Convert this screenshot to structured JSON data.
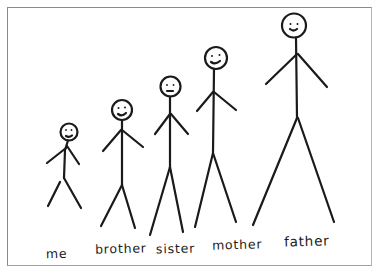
{
  "drawing": {
    "description": "Hand-drawn family of stick figures arranged by height",
    "figures": [
      {
        "id": "me",
        "label": "me"
      },
      {
        "id": "brother",
        "label": "brother"
      },
      {
        "id": "sister",
        "label": "sister"
      },
      {
        "id": "mother",
        "label": "mother"
      },
      {
        "id": "father",
        "label": "father"
      }
    ]
  },
  "colors": {
    "ink": "#1a1a1a",
    "paper": "#ffffff",
    "frame": "#8a8a8a"
  }
}
